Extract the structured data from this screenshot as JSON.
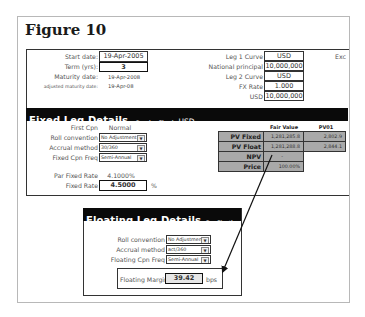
{
  "figure": {
    "title": "Figure 10"
  },
  "general": {
    "start_date_label": "Start date:",
    "start_date": "19-Apr-2005",
    "term_label": "Term (yrs):",
    "term": "3",
    "maturity_label": "Maturity date:",
    "maturity": "19-Apr-2008",
    "adj_maturity_label": "adjusted maturity date:",
    "adj_maturity": "19-Apr-08",
    "leg1_curve_label": "Leg 1 Curve",
    "leg1_curve": "USD",
    "notional_label": "National principal",
    "notional": "10,000,000",
    "leg2_curve_label": "Leg 2 Curve",
    "leg2_curve": "USD",
    "fx_rate_label": "FX Rate",
    "fx_rate": "1.000",
    "usd_label": "USD",
    "usd_amount": "10,000,000",
    "clipped_text": "Exc"
  },
  "fixed_leg": {
    "title": "Fixed Leg Details",
    "subtitle": "Receive Fixed",
    "currency": "USD",
    "first_cpn_label": "First Cpn",
    "first_cpn": "Normal",
    "roll_label": "Roll convention",
    "roll": "No Adjustment",
    "accrual_label": "Accrual method",
    "accrual": "30/360",
    "freq_label": "Fixed Cpn Freq",
    "freq": "Semi-Annual",
    "par_rate_label": "Par Fixed Rate",
    "par_rate": "4.1000%",
    "fixed_rate_label": "Fixed Rate",
    "fixed_rate": "4.5000",
    "fixed_rate_unit": "%"
  },
  "valuation": {
    "col_fair_value": "Fair Value",
    "col_pv01": "PV01",
    "rows": [
      {
        "label": "PV Fixed Leg",
        "fair_value": "1,281,285.8",
        "pv01": "2,802.9"
      },
      {
        "label": "PV Float Leg",
        "fair_value": "1,281,288.8",
        "pv01": "2,844.1"
      },
      {
        "label": "NPV",
        "fair_value": "-",
        "pv01": ""
      },
      {
        "label": "Price",
        "fair_value": "100.00%",
        "pv01": ""
      }
    ]
  },
  "floating_leg": {
    "title": "Floating Leg Details",
    "subtitle": "Pay Floating",
    "currency": "USD",
    "roll_label": "Roll convention",
    "roll": "No Adjustment",
    "accrual_label": "Accrual method",
    "accrual": "act/360",
    "freq_label": "Floating Cpn Freq",
    "freq": "Semi-Annual",
    "margin_label": "Floating Margin",
    "margin": "39.42",
    "margin_unit": "bps"
  },
  "icons": {
    "dropdown": "▼"
  }
}
